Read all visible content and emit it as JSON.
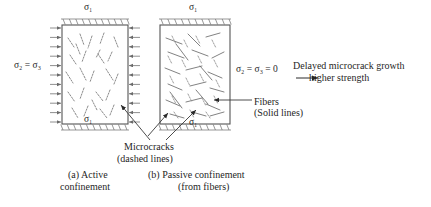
{
  "figure": {
    "background_color": "#ffffff",
    "line_color": "#555555",
    "text_color": "#1f1f1f"
  },
  "labels": {
    "sigma1_top_a": "σ₁",
    "sigma1_bottom_a": "σ₁",
    "sigma1_top_b": "σ₁",
    "sigma1_bottom_b": "σ₁",
    "sigma23_a": "σ₂ = σ₃",
    "sigma23_b": "σ₂ = σ₃ = 0",
    "delayed_growth": "Delayed microcrack growth",
    "higher_strength": "higher strength",
    "fibers_line1": "Fibers",
    "fibers_line2": "(Solid lines)",
    "microcracks_line1": "Microcracks",
    "microcracks_line2": "(dashed lines)",
    "caption_a_line1": "(a) Active",
    "caption_a_line2": "confinement",
    "caption_b_line1": "(b) Passive confinement",
    "caption_b_line2": "(from fibers)"
  },
  "panels": [
    {
      "id": "a",
      "name": "active-confinement",
      "caption": "(a) Active confinement",
      "axial_stress": "σ₁",
      "lateral_stress": "σ₂ = σ₃",
      "lateral_confinement": true,
      "has_fibers": false,
      "crack_style": "dashed",
      "box": {
        "x": 62,
        "y": 25,
        "w": 66,
        "h": 99
      }
    },
    {
      "id": "b",
      "name": "passive-confinement",
      "caption": "(b) Passive confinement (from fibers)",
      "axial_stress": "σ₁",
      "lateral_stress": "σ₂ = σ₃ = 0",
      "lateral_confinement": false,
      "has_fibers": true,
      "crack_style": "dashed",
      "fiber_style": "solid",
      "box": {
        "x": 160,
        "y": 25,
        "w": 70,
        "h": 99
      }
    }
  ],
  "legend": {
    "microcracks": "dashed lines",
    "fibers": "Solid lines"
  },
  "annotations": {
    "outcome_line1": "Delayed microcrack growth",
    "outcome_line2": "higher strength",
    "arrow": "right-arrow-icon"
  },
  "geometry": {
    "panel_a_cracks": [
      [
        68,
        38,
        74,
        47
      ],
      [
        80,
        34,
        84,
        45
      ],
      [
        92,
        36,
        88,
        48
      ],
      [
        104,
        33,
        100,
        44
      ],
      [
        114,
        37,
        118,
        47
      ],
      [
        70,
        55,
        76,
        64
      ],
      [
        86,
        51,
        82,
        62
      ],
      [
        98,
        54,
        104,
        63
      ],
      [
        112,
        52,
        108,
        61
      ],
      [
        66,
        72,
        73,
        83
      ],
      [
        80,
        68,
        86,
        80
      ],
      [
        94,
        71,
        90,
        82
      ],
      [
        106,
        69,
        113,
        80
      ],
      [
        118,
        74,
        114,
        84
      ],
      [
        68,
        92,
        75,
        102
      ],
      [
        84,
        88,
        80,
        99
      ],
      [
        96,
        92,
        103,
        101
      ],
      [
        110,
        90,
        106,
        100
      ],
      [
        72,
        108,
        78,
        118
      ],
      [
        88,
        106,
        84,
        116
      ],
      [
        100,
        109,
        107,
        118
      ],
      [
        114,
        105,
        110,
        115
      ],
      [
        76,
        44,
        80,
        54
      ],
      [
        100,
        50,
        96,
        58
      ],
      [
        92,
        100,
        97,
        110
      ]
    ],
    "panel_b_fibers": [
      [
        166,
        38,
        182,
        44
      ],
      [
        188,
        34,
        200,
        46
      ],
      [
        206,
        37,
        220,
        33
      ],
      [
        168,
        52,
        184,
        58
      ],
      [
        192,
        50,
        208,
        56
      ],
      [
        212,
        58,
        224,
        52
      ],
      [
        165,
        68,
        180,
        74
      ],
      [
        186,
        70,
        202,
        66
      ],
      [
        208,
        72,
        222,
        78
      ],
      [
        168,
        84,
        182,
        90
      ],
      [
        190,
        86,
        206,
        82
      ],
      [
        210,
        88,
        224,
        92
      ],
      [
        166,
        100,
        180,
        106
      ],
      [
        186,
        102,
        202,
        98
      ],
      [
        206,
        104,
        220,
        110
      ],
      [
        170,
        114,
        184,
        118
      ],
      [
        192,
        112,
        206,
        116
      ],
      [
        210,
        116,
        224,
        112
      ],
      [
        176,
        44,
        188,
        60
      ],
      [
        200,
        66,
        212,
        80
      ],
      [
        170,
        92,
        182,
        108
      ],
      [
        196,
        90,
        208,
        104
      ]
    ],
    "panel_b_cracks": [
      [
        172,
        36,
        176,
        44
      ],
      [
        184,
        40,
        188,
        48
      ],
      [
        196,
        36,
        200,
        44
      ],
      [
        212,
        40,
        216,
        48
      ],
      [
        168,
        56,
        172,
        64
      ],
      [
        182,
        60,
        186,
        68
      ],
      [
        198,
        56,
        202,
        64
      ],
      [
        214,
        60,
        218,
        68
      ],
      [
        170,
        76,
        174,
        84
      ],
      [
        186,
        78,
        190,
        86
      ],
      [
        200,
        74,
        204,
        82
      ],
      [
        216,
        80,
        220,
        88
      ],
      [
        172,
        96,
        176,
        104
      ],
      [
        188,
        94,
        192,
        102
      ],
      [
        202,
        98,
        206,
        106
      ],
      [
        214,
        96,
        218,
        104
      ],
      [
        174,
        112,
        178,
        118
      ],
      [
        190,
        110,
        194,
        118
      ],
      [
        206,
        112,
        210,
        118
      ]
    ]
  }
}
